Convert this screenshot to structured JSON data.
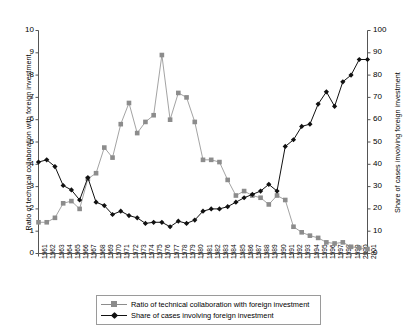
{
  "chart_data": {
    "type": "line",
    "title": "",
    "subtitle": "",
    "xlabel": "",
    "ylabel": "Ratio of technical collaboration with foreign investment",
    "y2label": "Share of cases involving foreign investment",
    "grid": false,
    "legend_position": "bottom",
    "x": [
      1961,
      1962,
      1963,
      1964,
      1965,
      1966,
      1967,
      1968,
      1969,
      1970,
      1971,
      1972,
      1973,
      1974,
      1975,
      1976,
      1977,
      1978,
      1979,
      1980,
      1981,
      1982,
      1983,
      1984,
      1985,
      1986,
      1987,
      1988,
      1989,
      1990,
      1991,
      1992,
      1993,
      1994,
      1995,
      1996,
      1997,
      1998,
      1999,
      2000,
      2001
    ],
    "xticklabels": [
      "1961",
      "1962",
      "1963",
      "1964",
      "1965",
      "1966",
      "1967",
      "1968",
      "1969",
      "1970",
      "1971",
      "1972",
      "1973",
      "1974",
      "1975",
      "1976",
      "1977",
      "1978",
      "1979",
      "1980",
      "1981",
      "1982",
      "1983",
      "1984",
      "1985",
      "1986",
      "1987",
      "1988",
      "1989",
      "1990",
      "1991",
      "1992",
      "1993",
      "1994",
      "1995",
      "1996",
      "1997",
      "1998",
      "1999",
      "2000",
      "2001"
    ],
    "ylim": [
      0,
      10
    ],
    "yticks": [
      0,
      1,
      2,
      3,
      4,
      5,
      6,
      7,
      8,
      9,
      10
    ],
    "yticklabels": [
      "0",
      "1",
      "2",
      "3",
      "4",
      "5",
      "6",
      "7",
      "8",
      "9",
      "10"
    ],
    "y2lim": [
      0,
      100
    ],
    "y2ticks": [
      0,
      10,
      20,
      30,
      40,
      50,
      60,
      70,
      80,
      90,
      100
    ],
    "y2ticklabels": [
      "0",
      "10",
      "20",
      "30",
      "40",
      "50",
      "60",
      "70",
      "80",
      "90",
      "100"
    ],
    "series": [
      {
        "name": "Ratio of technical collaboration with foreign investment",
        "axis": "left",
        "color": "#8c8c8c",
        "marker": "square",
        "values": [
          1.4,
          1.4,
          1.6,
          2.25,
          2.35,
          2.0,
          3.35,
          3.6,
          4.75,
          4.3,
          5.8,
          6.75,
          5.4,
          5.9,
          6.2,
          8.9,
          6.0,
          7.2,
          7.0,
          5.9,
          4.2,
          4.2,
          4.1,
          3.3,
          2.6,
          2.8,
          2.6,
          2.5,
          2.2,
          2.6,
          2.4,
          1.2,
          0.95,
          0.8,
          0.7,
          0.5,
          0.45,
          0.5,
          0.3,
          0.25,
          0.2
        ]
      },
      {
        "name": "Share of cases involving foreign investment",
        "axis": "right",
        "color": "#111111",
        "marker": "diamond",
        "values": [
          41,
          42,
          39,
          30.5,
          28.5,
          24,
          34,
          23,
          21.5,
          17.5,
          19,
          17,
          16,
          13.5,
          14,
          14,
          12,
          14.5,
          13.5,
          15,
          19,
          20,
          20,
          21,
          23,
          25,
          26.5,
          28,
          31,
          28,
          48,
          51,
          57,
          58,
          67,
          72.5,
          66,
          77,
          80,
          87,
          87
        ]
      }
    ]
  },
  "legend": {
    "items": [
      {
        "label": "Ratio of technical collaboration with foreign investment",
        "color": "#8c8c8c",
        "marker": "square"
      },
      {
        "label": "Share of cases involving foreign investment",
        "color": "#111111",
        "marker": "diamond"
      }
    ]
  }
}
